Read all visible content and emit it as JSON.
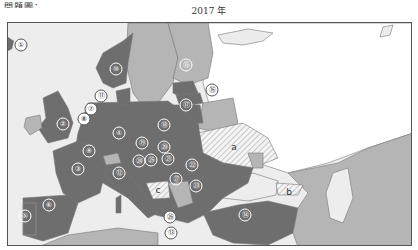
{
  "header": {
    "corner_text": "問題圖：",
    "title": "2017 年"
  },
  "legend_colors": {
    "sea": "#ededed",
    "member_dark": "#6e6e6e",
    "other_light": "#b5b5b5",
    "hatched": "#e4e4e4",
    "white_land": "#ffffff"
  },
  "map": {
    "numbered_regions": [
      {
        "id": "1",
        "label": "①"
      },
      {
        "id": "2",
        "label": "②"
      },
      {
        "id": "3",
        "label": "③"
      },
      {
        "id": "4",
        "label": "④"
      },
      {
        "id": "5",
        "label": "⑤"
      },
      {
        "id": "6",
        "label": "⑥"
      },
      {
        "id": "7",
        "label": "⑦"
      },
      {
        "id": "8",
        "label": "⑧"
      },
      {
        "id": "9",
        "label": "⑨"
      },
      {
        "id": "10",
        "label": "⑩"
      },
      {
        "id": "11",
        "label": "⑪"
      },
      {
        "id": "12",
        "label": "⑫"
      },
      {
        "id": "13",
        "label": "⑬"
      },
      {
        "id": "14",
        "label": "⑭"
      },
      {
        "id": "15",
        "label": "⑮"
      },
      {
        "id": "16",
        "label": "⑯"
      },
      {
        "id": "17",
        "label": "⑰"
      },
      {
        "id": "18",
        "label": "⑱"
      },
      {
        "id": "19",
        "label": "⑲"
      },
      {
        "id": "20",
        "label": "⑳"
      },
      {
        "id": "21",
        "label": "㉑"
      },
      {
        "id": "22",
        "label": "㉒"
      },
      {
        "id": "23",
        "label": "㉓"
      },
      {
        "id": "24",
        "label": "㉔"
      },
      {
        "id": "25",
        "label": "㉕"
      },
      {
        "id": "26",
        "label": "㉖"
      },
      {
        "id": "27",
        "label": "㉗"
      }
    ],
    "lettered_regions": [
      {
        "id": "a",
        "label": "a"
      },
      {
        "id": "b",
        "label": "b"
      },
      {
        "id": "c",
        "label": "c"
      }
    ]
  }
}
